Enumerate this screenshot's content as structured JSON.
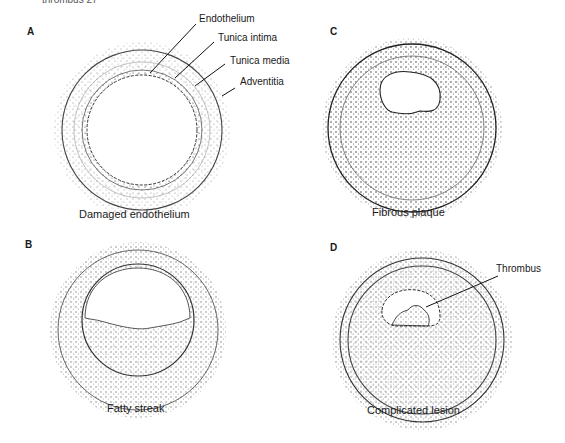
{
  "figure": {
    "top_cut_text": "thrombus 27",
    "panels": [
      {
        "letter": "A",
        "caption": "Damaged endothelium"
      },
      {
        "letter": "B",
        "caption": "Fatty streak"
      },
      {
        "letter": "C",
        "caption": "Fibrous plaque"
      },
      {
        "letter": "D",
        "caption": "Complicated lesion"
      }
    ],
    "labels_A": [
      "Endothelium",
      "Tunica intima",
      "Tunica media",
      "Adventitia"
    ],
    "label_D": "Thrombus"
  },
  "colors": {
    "ink": "#1a1a1a",
    "stipple": "#888888",
    "background": "#ffffff"
  }
}
